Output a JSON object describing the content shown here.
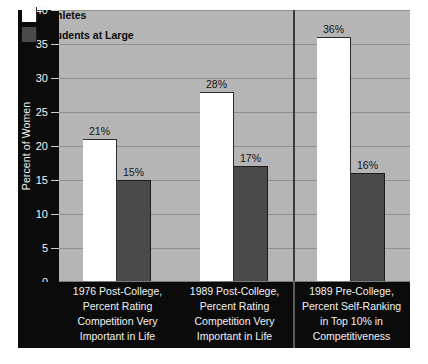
{
  "chart_data": {
    "type": "bar",
    "title": "",
    "xlabel": "",
    "ylabel": "Percent of Women",
    "ylim": [
      0,
      40
    ],
    "ytick_step": 5,
    "yticks": [
      40,
      35,
      30,
      25,
      20,
      15,
      10,
      5,
      0
    ],
    "ytick_labels": [
      "40",
      "35",
      "30",
      "25",
      "20",
      "15",
      "10",
      "5",
      "0"
    ],
    "grid": true,
    "legend_position": "top-left",
    "value_suffix": "%",
    "categories": [
      "1976 Post-College, Percent Rating Competition Very Important in Life",
      "1989 Post-College, Percent Rating Competition Very Important in Life",
      "1989 Pre-College, Percent Self-Ranking in Top 10% in Competitiveness"
    ],
    "category_lines": [
      [
        "1976 Post-College,",
        "Percent Rating",
        "Competition Very",
        "Important in Life"
      ],
      [
        "1989 Post-College,",
        "Percent Rating",
        "Competition Very",
        "Important in Life"
      ],
      [
        "1989 Pre-College,",
        "Percent Self-Ranking",
        "in Top 10% in",
        "Competitiveness"
      ]
    ],
    "series": [
      {
        "name": "Athletes",
        "color": "#ffffff",
        "values": [
          21,
          28,
          36
        ],
        "labels": [
          "21%",
          "28%",
          "36%"
        ]
      },
      {
        "name": "Students at Large",
        "color": "#4a4a4a",
        "values": [
          15,
          17,
          16
        ],
        "labels": [
          "15%",
          "17%",
          "16%"
        ]
      }
    ],
    "group_divider_after_category": 2
  },
  "legend": {
    "items": [
      {
        "label": "Athletes",
        "swatch": "white-swatch"
      },
      {
        "label": "Students at Large",
        "swatch": "dark-gray-swatch"
      }
    ]
  },
  "colors": {
    "plot_background": "#b5b5b5",
    "panel_background": "#0b0b0b",
    "gridline": "#8e8e8e",
    "athletes_bar": "#ffffff",
    "students_bar": "#4a4a4a",
    "axis_text": "#f2f2f2",
    "value_label_text": "#141414"
  }
}
